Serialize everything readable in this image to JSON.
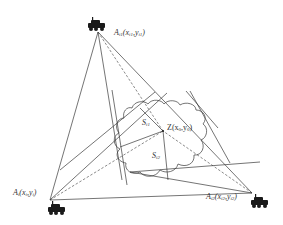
{
  "diagram": {
    "colors": {
      "line": "#3a3a3a",
      "vehicle": "#1a1a1a",
      "background": "#ffffff"
    },
    "nodes": [
      {
        "id": "Ai1",
        "label": "A",
        "sub": "i1",
        "coords": "(x",
        "coords_sub": "i1",
        "coords_sep": ",y",
        "coords_sub2": "i1",
        "close": ")",
        "x": 98,
        "y": 32,
        "icon": "vehicle-icon"
      },
      {
        "id": "Ai",
        "label": "A",
        "sub": "i",
        "coords": "(x",
        "coords_sub": "i",
        "coords_sep": ",y",
        "coords_sub2": "i",
        "close": ")",
        "x": 50,
        "y": 200,
        "icon": "vehicle-icon"
      },
      {
        "id": "Ai2",
        "label": "A",
        "sub": "i2",
        "coords": "(x",
        "coords_sub": "i2",
        "coords_sep": ",y",
        "coords_sub2": "i2",
        "close": ")",
        "x": 252,
        "y": 193,
        "icon": "vehicle-icon"
      }
    ],
    "target": {
      "id": "Z",
      "label": "Z(x",
      "sub": "0",
      "sep": ",y",
      "sub2": "0",
      "close": ")",
      "x": 163,
      "y": 131
    },
    "regions": [
      {
        "id": "Si1",
        "label": "S",
        "sub": "i1"
      },
      {
        "id": "Si2",
        "label": "S",
        "sub": "i2"
      }
    ],
    "obstacle": "cloud-shaped region"
  }
}
